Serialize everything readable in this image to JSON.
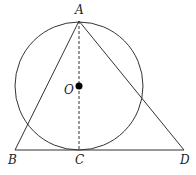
{
  "diagram": {
    "title": "",
    "circle": {
      "center": "O",
      "cx": 79,
      "cy": 86,
      "r": 64
    },
    "points": {
      "A": {
        "label": "A",
        "x": 79,
        "y": 21
      },
      "O": {
        "label": "O",
        "x": 79,
        "y": 86
      },
      "B": {
        "label": "B",
        "x": 15,
        "y": 150
      },
      "C": {
        "label": "C",
        "x": 79,
        "y": 150
      },
      "D": {
        "label": "D",
        "x": 184,
        "y": 150
      }
    },
    "segments": [
      {
        "from": "A",
        "to": "B",
        "style": "solid"
      },
      {
        "from": "A",
        "to": "D",
        "style": "solid"
      },
      {
        "from": "B",
        "to": "D",
        "style": "solid"
      },
      {
        "from": "A",
        "to": "C",
        "style": "dashed"
      }
    ],
    "colors": {
      "stroke": "#333333",
      "fill_dot": "#000000"
    }
  }
}
